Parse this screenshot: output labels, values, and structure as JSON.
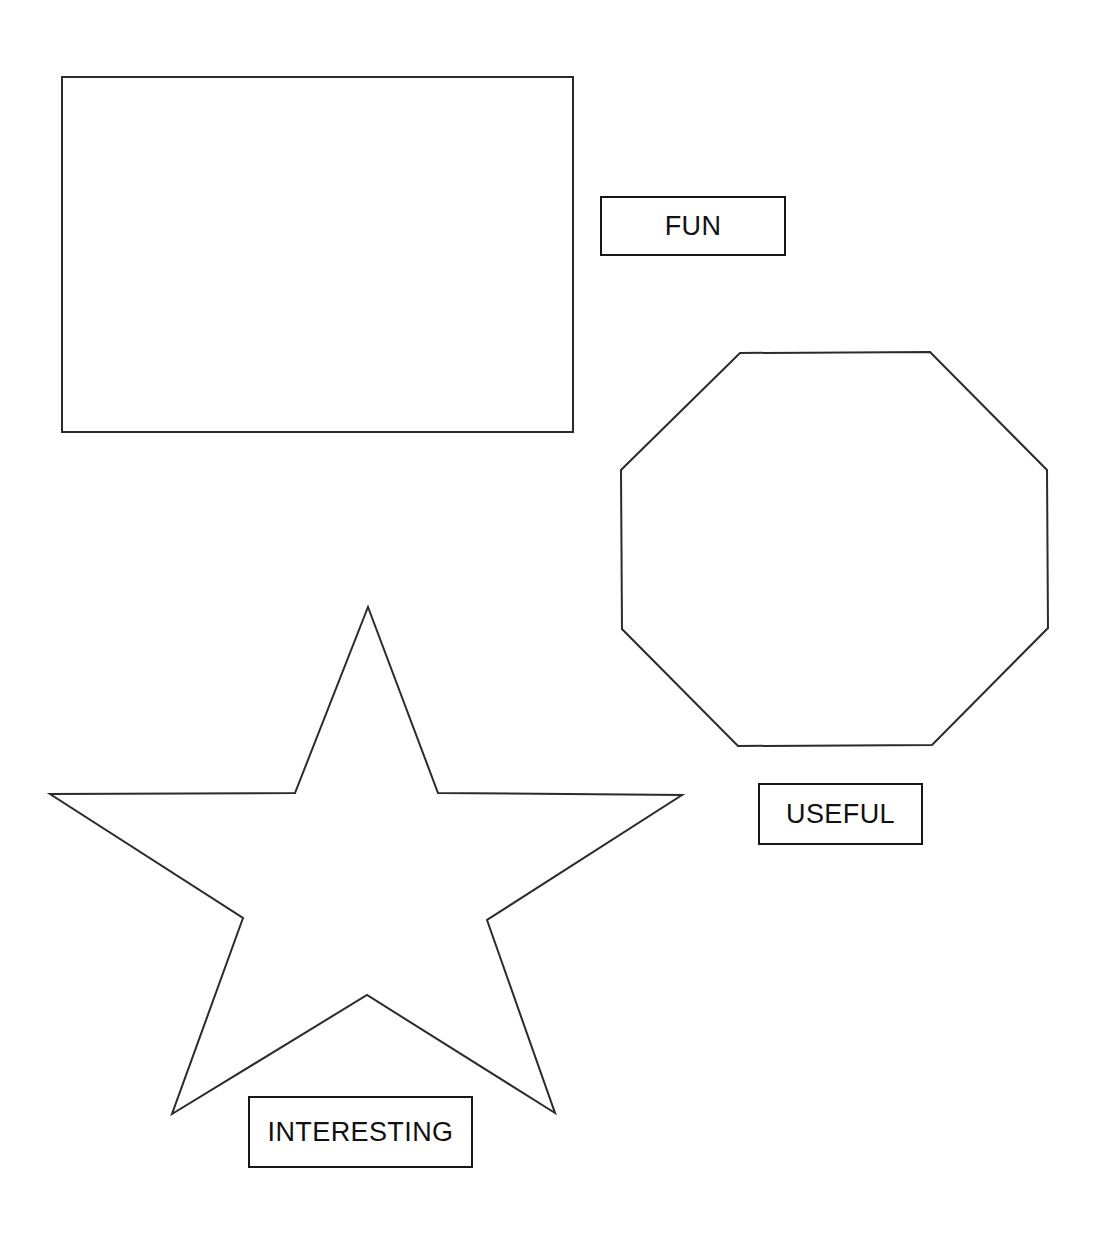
{
  "canvas": {
    "width": 1101,
    "height": 1237,
    "background_color": "#ffffff",
    "stroke_color": "#161616",
    "text_color": "#111111"
  },
  "shapes": [
    {
      "id": "rectangle",
      "name": "rectangle-shape",
      "kind": "rectangle",
      "stroke_color": "#2b2b2b",
      "fill": "none",
      "stroke_width": 2,
      "bounds": {
        "x": 62,
        "y": 77,
        "width": 511,
        "height": 355
      },
      "points": "62,77 573,77 573,432 62,432"
    },
    {
      "id": "octagon",
      "name": "octagon-shape",
      "kind": "octagon",
      "stroke_color": "#2b2b2b",
      "fill": "none",
      "stroke_width": 2,
      "bounds": {
        "x": 621,
        "y": 352,
        "width": 427,
        "height": 394
      },
      "points": "740,353 930,352 1047,470 1048,628 932,745 738,746 622,629 621,470"
    },
    {
      "id": "star",
      "name": "five-point-star-shape",
      "kind": "star",
      "points_count": 5,
      "stroke_color": "#2b2b2b",
      "fill": "none",
      "stroke_width": 2,
      "bounds": {
        "x": 48,
        "y": 606,
        "width": 634,
        "height": 509
      },
      "points": "368,607 438,793 682,795 487,920 555,1113 367,995 172,1114 243,918 50,794 295,793"
    }
  ],
  "labels": [
    {
      "id": "fun",
      "name": "label-fun",
      "text": "FUN",
      "box": {
        "x": 600,
        "y": 196,
        "width": 186,
        "height": 60
      },
      "font_size": 27,
      "border_color": "#161616",
      "text_color": "#111111",
      "associated_shape": "rectangle"
    },
    {
      "id": "useful",
      "name": "label-useful",
      "text": "USEFUL",
      "box": {
        "x": 758,
        "y": 783,
        "width": 165,
        "height": 62
      },
      "font_size": 27,
      "border_color": "#161616",
      "text_color": "#111111",
      "associated_shape": "octagon"
    },
    {
      "id": "interesting",
      "name": "label-interesting",
      "text": "INTERESTING",
      "box": {
        "x": 248,
        "y": 1096,
        "width": 225,
        "height": 72
      },
      "font_size": 27,
      "border_color": "#161616",
      "text_color": "#111111",
      "associated_shape": "star"
    }
  ]
}
